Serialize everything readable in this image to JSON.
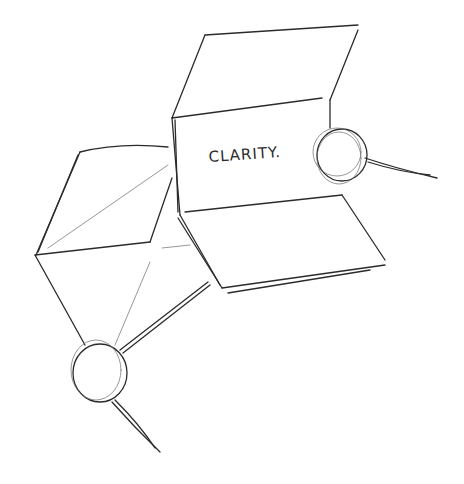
{
  "scene": {
    "description": "Pencil sketch of two hands holding folded paper sheets",
    "paper_text": "CLARITY.",
    "colors": {
      "background": "#ffffff",
      "stroke": "#2b2b2b",
      "light_stroke": "#6a6a6a"
    }
  }
}
